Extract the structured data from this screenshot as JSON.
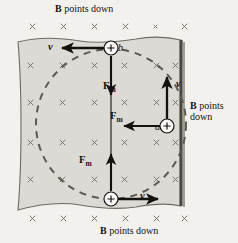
{
  "figure": {
    "type": "physics-diagram",
    "background_color": "#f2f1ee",
    "field_region_color": "#dcdad5",
    "ink_color": "#14120f"
  },
  "captions": {
    "top": {
      "bold": "B",
      "rest": " points down"
    },
    "right": {
      "bold": "B",
      "rest": " points",
      "line2": "down"
    },
    "bottom": {
      "bold": "B",
      "rest": " points down"
    }
  },
  "field": {
    "symbol": "×",
    "meaning": "magnetic-field-into-page",
    "rows": 6,
    "columns": 6
  },
  "charges": [
    {
      "id": "b",
      "label": "b",
      "sign": "+",
      "position": "top",
      "cx": 111,
      "cy": 48
    },
    {
      "id": "a",
      "label": "a",
      "sign": "+",
      "position": "right",
      "cx": 167,
      "cy": 126
    },
    {
      "id": "bottom",
      "label": "",
      "sign": "+",
      "position": "bottom",
      "cx": 111,
      "cy": 199
    }
  ],
  "vectors": {
    "velocity_label": "v",
    "force_label": {
      "base": "F",
      "sub": "m"
    },
    "items": [
      {
        "name": "velocity-top",
        "label": "v",
        "direction": "left",
        "at": "b"
      },
      {
        "name": "velocity-right",
        "label": "v",
        "direction": "up",
        "at": "a"
      },
      {
        "name": "velocity-bottom",
        "label": "v",
        "direction": "right",
        "at": "bottom"
      },
      {
        "name": "force-top",
        "label": "Fm",
        "direction": "down",
        "at": "b"
      },
      {
        "name": "force-right",
        "label": "Fm",
        "direction": "left",
        "at": "a"
      },
      {
        "name": "force-bottom",
        "label": "Fm",
        "direction": "up",
        "at": "bottom"
      }
    ]
  },
  "trajectory": {
    "shape": "circle",
    "style": "dashed",
    "center_x": 111,
    "center_y": 124,
    "radius": 75
  }
}
